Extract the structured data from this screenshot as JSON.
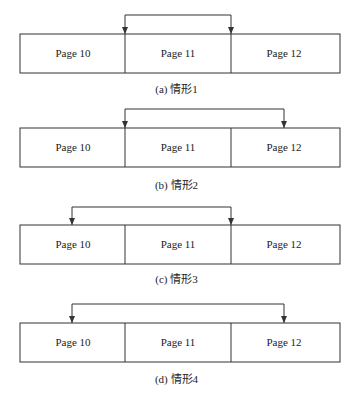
{
  "figures": [
    {
      "id": "a",
      "caption": "(a) 情形1",
      "pages": [
        "Page 10",
        "Page 11",
        "Page 12"
      ],
      "arrow": {
        "from": "Page 11 left edge",
        "to": "Page 12 left edge"
      }
    },
    {
      "id": "b",
      "caption": "(b) 情形2",
      "pages": [
        "Page 10",
        "Page 11",
        "Page 12"
      ],
      "arrow": {
        "from": "Page 11 left edge",
        "to": "Page 12 center"
      }
    },
    {
      "id": "c",
      "caption": "(c) 情形3",
      "pages": [
        "Page 10",
        "Page 11",
        "Page 12"
      ],
      "arrow": {
        "from": "Page 10 center",
        "to": "Page 12 left edge"
      }
    },
    {
      "id": "d",
      "caption": "(d) 情形4",
      "pages": [
        "Page 10",
        "Page 11",
        "Page 12"
      ],
      "arrow": {
        "from": "Page 10 center",
        "to": "Page 12 center"
      }
    }
  ],
  "colors": {
    "stroke": "#333333",
    "background": "#ffffff"
  }
}
